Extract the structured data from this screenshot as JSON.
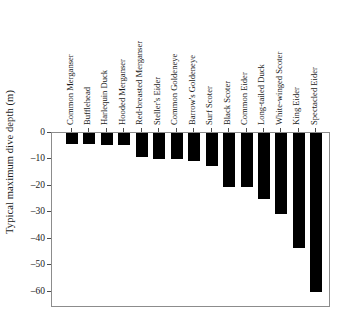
{
  "chart_data": {
    "type": "bar",
    "title": "",
    "xlabel": "",
    "ylabel": "Typical maximum dive depth (m)",
    "ylim": [
      -65,
      0
    ],
    "yticks": [
      0,
      -10,
      -20,
      -30,
      -40,
      -50,
      -60
    ],
    "ytick_labels": [
      "0",
      "-10",
      "-20",
      "-30",
      "-40",
      "-50",
      "-60"
    ],
    "grid": false,
    "legend": null,
    "orientation": "vertical",
    "bar_color": "#000000",
    "categories": [
      "Common Merganser",
      "Bufflehead",
      "Harlequin Duck",
      "Hooded Merganser",
      "Red-breasted Merganser",
      "Steller's Eider",
      "Common Goldeneye",
      "Barrow's Goldeneye",
      "Surf Scoter",
      "Black Scoter",
      "Common Eider",
      "Long-tailed Duck",
      "White-winged Scoter",
      "King Eider",
      "Spectacled Eider"
    ],
    "values": [
      -4,
      -4,
      -4.5,
      -4.5,
      -9,
      -10,
      -10,
      -10.5,
      -12.5,
      -20.5,
      -20.5,
      -25,
      -30.5,
      -43.5,
      -60
    ]
  }
}
